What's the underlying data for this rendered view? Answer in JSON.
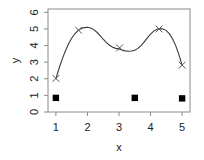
{
  "chart_data": {
    "type": "line",
    "title": "",
    "xlabel": "x",
    "ylabel": "y",
    "xlim": [
      0.75,
      5.25
    ],
    "ylim": [
      0,
      6.2
    ],
    "xticks": [
      1,
      2,
      3,
      4,
      5
    ],
    "xtick_labels": [
      "1",
      "2",
      "3",
      "4",
      "5"
    ],
    "yticks": [
      0,
      1,
      2,
      3,
      4,
      5,
      6
    ],
    "ytick_labels": [
      "0",
      "1",
      "2",
      "3",
      "4",
      "5",
      "6"
    ],
    "grid": false,
    "legend": false,
    "series": [
      {
        "name": "fitted-curve",
        "type": "line",
        "marker": "none",
        "color": "#3a3a3a",
        "x": [
          1.0,
          1.1,
          1.2,
          1.3,
          1.4,
          1.5,
          1.6,
          1.7,
          1.8,
          1.9,
          2.0,
          2.1,
          2.2,
          2.3,
          2.4,
          2.5,
          2.6,
          2.7,
          2.8,
          2.9,
          3.0,
          3.1,
          3.2,
          3.3,
          3.4,
          3.5,
          3.6,
          3.7,
          3.8,
          3.9,
          4.0,
          4.1,
          4.2,
          4.3,
          4.4,
          4.5,
          4.6,
          4.7,
          4.8,
          4.9,
          5.0
        ],
        "y": [
          2.0,
          2.62,
          3.18,
          3.67,
          4.09,
          4.44,
          4.71,
          4.9,
          5.02,
          5.08,
          5.1,
          5.06,
          4.96,
          4.8,
          4.6,
          4.38,
          4.18,
          4.02,
          3.9,
          3.83,
          3.8,
          3.73,
          3.68,
          3.66,
          3.67,
          3.72,
          3.83,
          4.0,
          4.22,
          4.46,
          4.69,
          4.87,
          4.98,
          5.02,
          5.0,
          4.9,
          4.7,
          4.4,
          3.98,
          3.44,
          2.82
        ]
      },
      {
        "name": "observed-points",
        "type": "scatter",
        "marker": "x",
        "color": "#555555",
        "x": [
          1.0,
          1.72,
          3.02,
          4.27,
          5.0
        ],
        "y": [
          2.02,
          4.92,
          3.86,
          5.0,
          2.82
        ]
      },
      {
        "name": "knot-points",
        "type": "scatter",
        "marker": "filled-square",
        "color": "#000000",
        "x": [
          1.0,
          3.5,
          5.0
        ],
        "y": [
          0.85,
          0.85,
          0.82
        ]
      }
    ]
  }
}
